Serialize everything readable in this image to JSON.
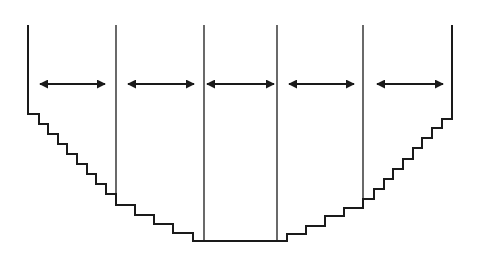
{
  "diagram": {
    "stroke_color": "#1a1a1a",
    "background": "#ffffff",
    "outline_points": [
      [
        28,
        25
      ],
      [
        28,
        114
      ],
      [
        39,
        114
      ],
      [
        39,
        124
      ],
      [
        48,
        124
      ],
      [
        48,
        134
      ],
      [
        58,
        134
      ],
      [
        58,
        144
      ],
      [
        67,
        144
      ],
      [
        67,
        154
      ],
      [
        77,
        154
      ],
      [
        77,
        164
      ],
      [
        87,
        164
      ],
      [
        87,
        174
      ],
      [
        96,
        174
      ],
      [
        96,
        184
      ],
      [
        106,
        184
      ],
      [
        106,
        194
      ],
      [
        116,
        194
      ],
      [
        116,
        205
      ],
      [
        135,
        205
      ],
      [
        135,
        215
      ],
      [
        154,
        215
      ],
      [
        154,
        224
      ],
      [
        173,
        224
      ],
      [
        173,
        233
      ],
      [
        193,
        233
      ],
      [
        193,
        241
      ],
      [
        287,
        241
      ],
      [
        287,
        234
      ],
      [
        306,
        234
      ],
      [
        306,
        226
      ],
      [
        325,
        226
      ],
      [
        325,
        216
      ],
      [
        344,
        216
      ],
      [
        344,
        208
      ],
      [
        363,
        208
      ],
      [
        363,
        199
      ],
      [
        374,
        199
      ],
      [
        374,
        189
      ],
      [
        384,
        189
      ],
      [
        384,
        179
      ],
      [
        393,
        179
      ],
      [
        393,
        169
      ],
      [
        403,
        169
      ],
      [
        403,
        159
      ],
      [
        413,
        159
      ],
      [
        413,
        148
      ],
      [
        422,
        148
      ],
      [
        422,
        138
      ],
      [
        432,
        138
      ],
      [
        432,
        128
      ],
      [
        442,
        128
      ],
      [
        442,
        119
      ],
      [
        452,
        119
      ],
      [
        452,
        25
      ]
    ],
    "dividers": [
      {
        "x": 116,
        "y1": 25,
        "y2": 205
      },
      {
        "x": 204,
        "y1": 25,
        "y2": 241
      },
      {
        "x": 277,
        "y1": 25,
        "y2": 241
      },
      {
        "x": 363,
        "y1": 25,
        "y2": 208
      }
    ],
    "arrows": [
      {
        "x1": 40,
        "x2": 105,
        "y": 84
      },
      {
        "x1": 128,
        "x2": 194,
        "y": 84
      },
      {
        "x1": 207,
        "x2": 274,
        "y": 84
      },
      {
        "x1": 289,
        "x2": 354,
        "y": 84
      },
      {
        "x1": 377,
        "x2": 443,
        "y": 84
      }
    ]
  }
}
